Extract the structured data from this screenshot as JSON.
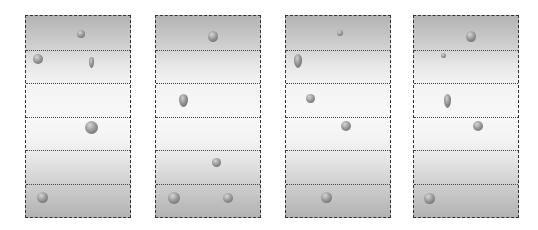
{
  "diagram": {
    "colors": {
      "background": "#ffffff",
      "border": "#333333",
      "gradient_dark": "#b3b3b3",
      "gradient_light": "#f8f8f8"
    },
    "rows_per_panel": 6,
    "panels": [
      {
        "id": "panel-1",
        "left": 25,
        "objects": [
          {
            "type": "ball",
            "x": 81,
            "y": 34,
            "w": 8,
            "h": 8
          },
          {
            "type": "ball",
            "x": 38,
            "y": 59,
            "w": 10,
            "h": 10
          },
          {
            "type": "drop",
            "x": 92,
            "y": 63,
            "w": 5,
            "h": 11
          },
          {
            "type": "ball",
            "x": 92,
            "y": 128,
            "w": 13,
            "h": 13
          },
          {
            "type": "ball",
            "x": 43,
            "y": 198,
            "w": 11,
            "h": 11
          }
        ]
      },
      {
        "id": "panel-2",
        "left": 155,
        "objects": [
          {
            "type": "ball",
            "x": 213,
            "y": 37,
            "w": 10,
            "h": 11
          },
          {
            "type": "drop",
            "x": 184,
            "y": 101,
            "w": 9,
            "h": 13
          },
          {
            "type": "ball",
            "x": 217,
            "y": 163,
            "w": 9,
            "h": 9
          },
          {
            "type": "ball",
            "x": 174,
            "y": 198,
            "w": 12,
            "h": 12
          },
          {
            "type": "ball",
            "x": 228,
            "y": 198,
            "w": 10,
            "h": 10
          }
        ]
      },
      {
        "id": "panel-3",
        "left": 285,
        "objects": [
          {
            "type": "ball",
            "x": 340,
            "y": 33,
            "w": 6,
            "h": 6
          },
          {
            "type": "drop",
            "x": 298,
            "y": 61,
            "w": 8,
            "h": 14
          },
          {
            "type": "ball",
            "x": 311,
            "y": 99,
            "w": 9,
            "h": 9
          },
          {
            "type": "ball",
            "x": 346,
            "y": 126,
            "w": 10,
            "h": 10
          },
          {
            "type": "ball",
            "x": 327,
            "y": 198,
            "w": 11,
            "h": 11
          }
        ]
      },
      {
        "id": "panel-4",
        "left": 413,
        "objects": [
          {
            "type": "ball",
            "x": 471,
            "y": 37,
            "w": 10,
            "h": 11
          },
          {
            "type": "ball",
            "x": 444,
            "y": 56,
            "w": 5,
            "h": 5
          },
          {
            "type": "drop",
            "x": 448,
            "y": 101,
            "w": 7,
            "h": 14
          },
          {
            "type": "ball",
            "x": 478,
            "y": 126,
            "w": 10,
            "h": 10
          },
          {
            "type": "ball",
            "x": 430,
            "y": 199,
            "w": 11,
            "h": 11
          }
        ]
      }
    ]
  }
}
